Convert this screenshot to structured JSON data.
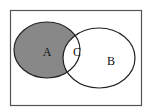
{
  "diagram": {
    "type": "venn",
    "universe": {
      "border_color": "#555555"
    },
    "sets": [
      {
        "id": "A",
        "label": "A",
        "fill": "#888888"
      },
      {
        "id": "B",
        "label": "B",
        "fill": "#ffffff"
      }
    ],
    "intersection": {
      "label": "C",
      "fill": "#ffffff"
    },
    "shaded_region": "A only (A minus B)"
  }
}
